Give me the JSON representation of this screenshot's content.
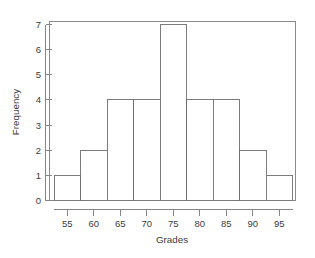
{
  "chart_data": {
    "type": "bar",
    "title": "",
    "subtitle": "",
    "xlabel": "Grades",
    "ylabel": "Frequency",
    "categories": [
      "55",
      "60",
      "65",
      "70",
      "75",
      "80",
      "85",
      "90",
      "95"
    ],
    "values": [
      1,
      2,
      4,
      4,
      7,
      4,
      4,
      2,
      1
    ],
    "bin_width": 5,
    "bin_edges": [
      52.5,
      57.5,
      62.5,
      67.5,
      72.5,
      77.5,
      82.5,
      87.5,
      92.5,
      97.5
    ],
    "xlim": [
      52.5,
      97.5
    ],
    "ylim": [
      0,
      7
    ],
    "xticks": [
      55,
      60,
      65,
      70,
      75,
      80,
      85,
      90,
      95
    ],
    "yticks": [
      0,
      1,
      2,
      3,
      4,
      5,
      6,
      7
    ],
    "xtick_labels": [
      "55",
      "60",
      "65",
      "70",
      "75",
      "80",
      "85",
      "90",
      "95"
    ],
    "ytick_labels": [
      "0",
      "1",
      "2",
      "3",
      "4",
      "5",
      "6",
      "7"
    ],
    "grid": false,
    "legend": null,
    "legend_position": "none",
    "bar_fill_color": "#ffffff",
    "bar_stroke_color": "#6e6e6e",
    "axis_color": "#868686",
    "text_color": "#3b3b3b",
    "background_color": "#ffffff"
  },
  "figure": {
    "alt": "Histogram of grades frequency distribution"
  }
}
